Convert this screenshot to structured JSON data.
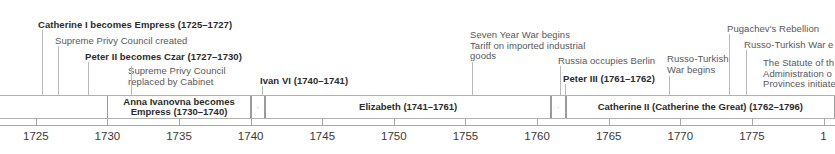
{
  "chart_data": {
    "type": "timeline",
    "xlabel": "",
    "axis": {
      "start_year": 1722.5,
      "end_year": 1780.8,
      "tick_step": 5,
      "ticks": [
        {
          "label": "1725",
          "year": 1725
        },
        {
          "label": "1730",
          "year": 1730
        },
        {
          "label": "1735",
          "year": 1735
        },
        {
          "label": "1740",
          "year": 1740
        },
        {
          "label": "1745",
          "year": 1745
        },
        {
          "label": "1750",
          "year": 1750
        },
        {
          "label": "1755",
          "year": 1755
        },
        {
          "label": "1760",
          "year": 1760
        },
        {
          "label": "1765",
          "year": 1765
        },
        {
          "label": "1770",
          "year": 1770
        },
        {
          "label": "1775",
          "year": 1775
        },
        {
          "label": "1",
          "year": 1780
        }
      ]
    },
    "eras": [
      {
        "label": "Anna Ivanovna becomes\nEmpress (1730–1740)",
        "start_year": 1730,
        "end_year": 1740,
        "narrow": false
      },
      {
        "label": "·",
        "start_year": 1740,
        "end_year": 1741,
        "narrow": true
      },
      {
        "label": "Elizabeth (1741–1761)",
        "start_year": 1741,
        "end_year": 1761,
        "narrow": false
      },
      {
        "label": "·",
        "start_year": 1761,
        "end_year": 1762,
        "narrow": true
      },
      {
        "label": "Catherine II (Catherine the Great) (1762–1796)",
        "start_year": 1762,
        "end_year": 1780.8,
        "narrow": false
      }
    ],
    "events": [
      {
        "label": "Catherine I becomes Empress (1725–1727)",
        "year": 1725,
        "bold": true,
        "text_x": 38,
        "text_y": 20,
        "leader_x": 42,
        "leader_top": 30,
        "leader_bottom": 95
      },
      {
        "label": "Supreme Privy Council created",
        "year": 1726,
        "bold": false,
        "text_x": 55,
        "text_y": 36,
        "leader_x": 58,
        "leader_top": 46,
        "leader_bottom": 95
      },
      {
        "label": "Peter II becomes Czar (1727–1730)",
        "year": 1727,
        "bold": true,
        "text_x": 85,
        "text_y": 52,
        "leader_x": 88,
        "leader_top": 62,
        "leader_bottom": 95
      },
      {
        "label": "Supreme Privy Council\nreplaced by Cabinet",
        "year": 1731,
        "bold": false,
        "text_x": 128,
        "text_y": 66,
        "leader_x": 131,
        "leader_top": 66,
        "leader_bottom": 95
      },
      {
        "label": "Ivan VI (1740–1741)",
        "year": 1740,
        "bold": true,
        "text_x": 260,
        "text_y": 76,
        "leader_x": 262,
        "leader_top": 86,
        "leader_bottom": 95
      },
      {
        "label": "Seven Year War begins\nTariff on imported industrial\ngoods",
        "year": 1756,
        "bold": false,
        "text_x": 470,
        "text_y": 30,
        "leader_x": 472,
        "leader_top": 62,
        "leader_bottom": 95
      },
      {
        "label": "Russia occupies Berlin",
        "year": 1760,
        "bold": false,
        "text_x": 558,
        "text_y": 56,
        "leader_x": 560,
        "leader_top": 66,
        "leader_bottom": 95
      },
      {
        "label": "Peter III (1761–1762)",
        "year": 1761,
        "bold": true,
        "text_x": 563,
        "text_y": 74,
        "leader_x": 565,
        "leader_top": 84,
        "leader_bottom": 95
      },
      {
        "label": "Russo-Turkish\nWar begins",
        "year": 1768,
        "bold": false,
        "text_x": 667,
        "text_y": 54,
        "leader_x": 669,
        "leader_top": 76,
        "leader_bottom": 95
      },
      {
        "label": "Pugachev's Rebellion",
        "year": 1773,
        "bold": false,
        "text_x": 727,
        "text_y": 24,
        "leader_x": 729,
        "leader_top": 34,
        "leader_bottom": 95
      },
      {
        "label": "Russo-Turkish War e",
        "year": 1774,
        "bold": false,
        "text_x": 744,
        "text_y": 40,
        "leader_x": 746,
        "leader_top": 50,
        "leader_bottom": 95
      },
      {
        "label": "The Statute of th\nAdministration o\nProvinces initiate",
        "year": 1775,
        "bold": false,
        "text_x": 763,
        "text_y": 58,
        "leader_x": 0,
        "leader_top": 0,
        "leader_bottom": 0
      }
    ]
  },
  "colors": {
    "background": "#ffffff",
    "text_light": "#58585a",
    "text_dark": "#2b2b2b",
    "border": "#9a9a9a",
    "axis": "#a8a8a8",
    "leader": "#b9b9b9"
  }
}
